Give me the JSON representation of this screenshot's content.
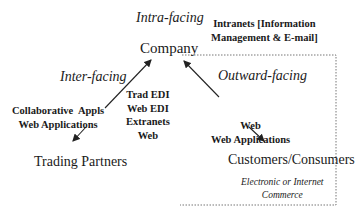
{
  "diagram": {
    "center_node": {
      "label": "Company",
      "above_label": "Intra-facing"
    },
    "intranets": {
      "lines": [
        "Intranets [Information",
        "Management & E-mail]"
      ]
    },
    "inter_facing": {
      "label": "Inter-facing",
      "edge_tools": [
        "Trad EDI",
        "Web EDI",
        "Extranets",
        "Web"
      ],
      "collab_tools": [
        "Collaborative  Appls",
        "Web Applications"
      ],
      "target_node": "Trading Partners"
    },
    "outward_facing": {
      "label": "Outward-facing",
      "edge_tools": [
        "Web",
        "Web Applications"
      ],
      "target_node": "Customers/Consumers",
      "caption": [
        "Electronic or Internet",
        "Commerce"
      ]
    },
    "style": {
      "line_color": "#222222",
      "dotted_box_color": "#777777"
    }
  }
}
